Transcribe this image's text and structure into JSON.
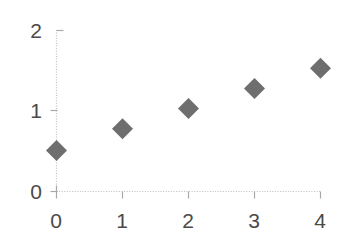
{
  "chart_data": {
    "type": "scatter",
    "title": "",
    "subtitle": "",
    "xlabel": "",
    "ylabel": "",
    "x": [
      0,
      1,
      2,
      3,
      4
    ],
    "values": [
      0.51,
      0.78,
      1.03,
      1.28,
      1.53
    ],
    "series": [
      {
        "name": "Series 1",
        "marker": "diamond",
        "color": "#6e6e6e",
        "points": [
          {
            "x": 0,
            "y": 0.51
          },
          {
            "x": 1,
            "y": 0.78
          },
          {
            "x": 2,
            "y": 1.03
          },
          {
            "x": 3,
            "y": 1.28
          },
          {
            "x": 4,
            "y": 1.53
          }
        ]
      }
    ],
    "xlim": [
      0,
      4
    ],
    "ylim": [
      0,
      2
    ],
    "x_ticks": [
      0,
      1,
      2,
      3,
      4
    ],
    "y_ticks": [
      0,
      1,
      2
    ],
    "x_tick_labels": [
      "0",
      "1",
      "2",
      "3",
      "4"
    ],
    "y_tick_labels": [
      "0",
      "1",
      "2"
    ],
    "grid": false,
    "legend": false,
    "legend_position": "none",
    "axis_color": "#b4b4b4",
    "axis_style": "dotted",
    "tick_label_color": "#4a4a4a",
    "background_color": "#ffffff"
  },
  "axes": {
    "y_labels": [
      {
        "text": "2",
        "value": 2
      },
      {
        "text": "1",
        "value": 1
      },
      {
        "text": "0",
        "value": 0
      }
    ],
    "x_labels": [
      {
        "text": "0",
        "value": 0
      },
      {
        "text": "1",
        "value": 1
      },
      {
        "text": "2",
        "value": 2
      },
      {
        "text": "3",
        "value": 3
      },
      {
        "text": "4",
        "value": 4
      }
    ]
  }
}
